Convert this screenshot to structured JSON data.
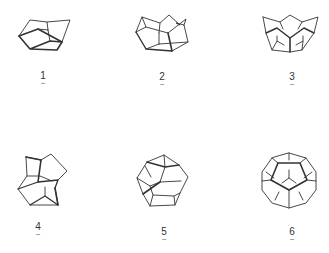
{
  "figure": {
    "line_color": "#333333",
    "structures": [
      {
        "id": 1,
        "label": "1",
        "underline": "~"
      },
      {
        "id": 2,
        "label": "2",
        "underline": "~"
      },
      {
        "id": 3,
        "label": "3",
        "underline": "~"
      },
      {
        "id": 4,
        "label": "4",
        "underline": "~"
      },
      {
        "id": 5,
        "label": "5",
        "underline": "~"
      },
      {
        "id": 6,
        "label": "6",
        "underline": "~"
      }
    ]
  }
}
